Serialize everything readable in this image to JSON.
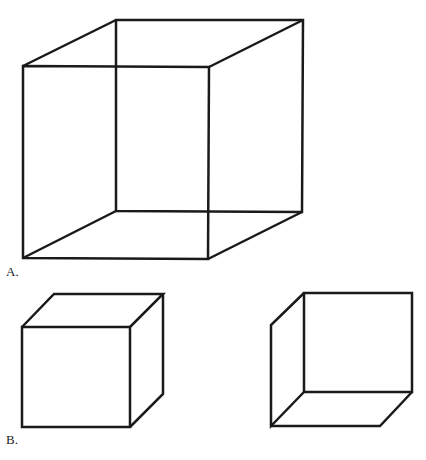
{
  "figure": {
    "panel_a": {
      "label": "A.",
      "description": "Necker cube (wireframe, ambiguous)",
      "front_face": [
        [
          23,
          66
        ],
        [
          209,
          67
        ],
        [
          208,
          259
        ],
        [
          23,
          258
        ]
      ],
      "back_face": [
        [
          116,
          20
        ],
        [
          303,
          20
        ],
        [
          302,
          212
        ],
        [
          116,
          211
        ]
      ]
    },
    "panel_b": {
      "label": "B.",
      "left_cube": {
        "description": "Cube viewed from above (front face lower-left)",
        "front_face": [
          [
            22,
            327
          ],
          [
            130,
            327
          ],
          [
            130,
            427
          ],
          [
            22,
            427
          ]
        ],
        "top_back": [
          [
            54,
            294
          ],
          [
            163,
            294
          ]
        ],
        "right_back_bottom": [
          163,
          394
        ]
      },
      "right_cube": {
        "description": "Cube viewed from below (back face upper-right)",
        "back_face": [
          [
            304,
            293
          ],
          [
            412,
            293
          ],
          [
            412,
            392
          ],
          [
            304,
            392
          ]
        ],
        "left_front": [
          [
            271,
            325
          ],
          [
            271,
            426
          ]
        ],
        "bottom_front_right": [
          380,
          426
        ]
      }
    },
    "stroke_color": "#1a1a1a"
  }
}
